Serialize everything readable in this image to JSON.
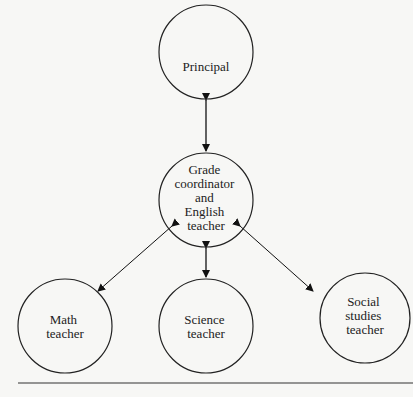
{
  "diagram": {
    "nodes": [
      {
        "id": "principal",
        "lines": [
          "Principal"
        ]
      },
      {
        "id": "grade",
        "lines": [
          "Grade",
          "coordinator",
          "and",
          "English",
          "teacher"
        ]
      },
      {
        "id": "math",
        "lines": [
          "Math",
          "teacher"
        ]
      },
      {
        "id": "science",
        "lines": [
          "Science",
          "teacher"
        ]
      },
      {
        "id": "social",
        "lines": [
          "Social",
          "studies",
          "teacher"
        ]
      }
    ],
    "edges": [
      {
        "from": "principal",
        "to": "grade",
        "type": "bidirectional"
      },
      {
        "from": "grade",
        "to": "math",
        "type": "bidirectional"
      },
      {
        "from": "grade",
        "to": "science",
        "type": "bidirectional"
      },
      {
        "from": "grade",
        "to": "social",
        "type": "bidirectional"
      }
    ]
  }
}
